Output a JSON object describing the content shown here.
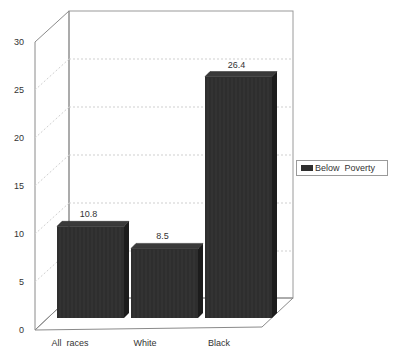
{
  "chart_data": {
    "type": "bar",
    "title": "",
    "xlabel": "",
    "ylabel": "",
    "categories": [
      "All  races",
      "White",
      "Black"
    ],
    "series": [
      {
        "name": "Below  Poverty",
        "values": [
          10.8,
          8.5,
          26.4
        ],
        "color": "#2e2e2e"
      }
    ],
    "value_labels": [
      "10.8",
      "8.5",
      "26.4"
    ],
    "ylim": [
      0,
      30
    ],
    "yticks": [
      0,
      5,
      10,
      15,
      20,
      25,
      30
    ],
    "ytick_labels": [
      "0",
      "5",
      "10",
      "15",
      "20",
      "25",
      "30"
    ],
    "grid": true,
    "style": "3d",
    "legend_position": "right"
  },
  "legend": {
    "label": "Below  Poverty",
    "swatch_color": "#2e2e2e"
  }
}
